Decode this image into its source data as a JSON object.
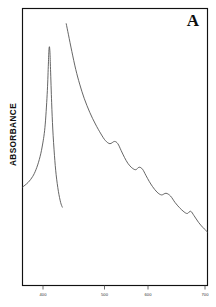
{
  "figure": {
    "panel_letter": "A",
    "y_axis_label": "ABSORBANCE",
    "background_color": "#ffffff",
    "frame_color": "#111111",
    "trace_color": "#4a4a4a"
  },
  "chart_data": {
    "type": "line",
    "title": "A",
    "xlabel": "",
    "ylabel": "ABSORBANCE",
    "xlim": [
      370,
      700
    ],
    "ylim": [
      0,
      1
    ],
    "grid": false,
    "legend": null,
    "xticks": [
      400,
      500,
      600,
      700
    ],
    "xtick_labels": [
      "400",
      "500",
      "600",
      "700"
    ],
    "yticks": [],
    "ytick_labels": [],
    "annotations": [
      {
        "text": "A",
        "position": "top-right"
      }
    ],
    "series": [
      {
        "name": "Soret band (on-scale, clipped)",
        "comment": "sharp intense Soret peak near 418 nm, trace truncated on its descending flank",
        "x": [
          370,
          380,
          388,
          394,
          400,
          405,
          410,
          414,
          416,
          417,
          418,
          419,
          420,
          422,
          424,
          427,
          430,
          434,
          438,
          441
        ],
        "y": [
          0.355,
          0.372,
          0.393,
          0.418,
          0.455,
          0.5,
          0.57,
          0.69,
          0.79,
          0.845,
          0.862,
          0.84,
          0.78,
          0.66,
          0.565,
          0.47,
          0.4,
          0.34,
          0.3,
          0.283
        ]
      },
      {
        "name": "Expanded-scale visible trace",
        "comment": "off-scale Soret tail descending through four Q bands",
        "x": [
          448,
          452,
          458,
          465,
          472,
          480,
          490,
          500,
          510,
          518,
          526,
          534,
          540,
          546,
          552,
          558,
          565,
          572,
          578,
          584,
          590,
          596,
          602,
          610,
          618,
          626,
          634,
          642,
          650,
          658,
          664,
          670,
          676,
          684,
          692,
          700
        ],
        "y": [
          0.945,
          0.905,
          0.845,
          0.78,
          0.727,
          0.676,
          0.625,
          0.583,
          0.547,
          0.523,
          0.512,
          0.52,
          0.512,
          0.487,
          0.462,
          0.441,
          0.425,
          0.418,
          0.427,
          0.42,
          0.398,
          0.376,
          0.357,
          0.337,
          0.327,
          0.333,
          0.323,
          0.3,
          0.281,
          0.266,
          0.26,
          0.268,
          0.252,
          0.228,
          0.209,
          0.193
        ]
      }
    ],
    "peaks": [
      {
        "label": "Soret",
        "x": 418,
        "y": 0.862
      },
      {
        "label": "Q1",
        "x": 527,
        "y": 0.513
      },
      {
        "label": "Q2",
        "x": 575,
        "y": 0.423
      },
      {
        "label": "Q3",
        "x": 620,
        "y": 0.33
      },
      {
        "label": "Q4",
        "x": 666,
        "y": 0.262
      }
    ]
  },
  "geometry": {
    "frame_left": 22.5,
    "frame_top": 8.5,
    "frame_right": 207.5,
    "frame_bottom": 285.5,
    "x_pixel_400": 43,
    "x_pixel_500": 104.5,
    "x_pixel_600": 148,
    "x_pixel_700": 205
  }
}
